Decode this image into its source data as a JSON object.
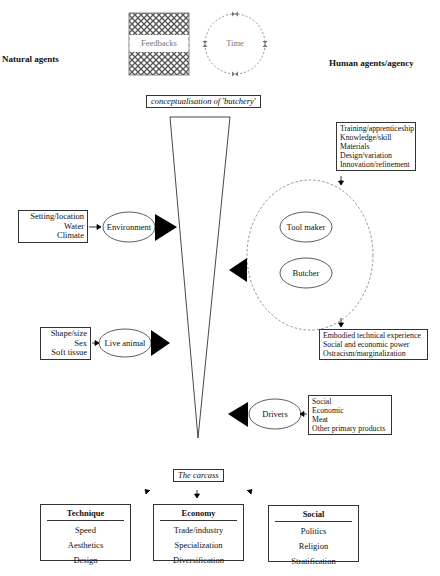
{
  "diagram": {
    "left_heading": "Natural agents",
    "right_heading": "Human agents/agency",
    "top_icons": {
      "feedbacks_label": "Feedbacks",
      "time_label": "Time"
    },
    "top_label": "conceptualisation of 'butchery'",
    "bottom_label": "The carcass",
    "natural": {
      "environment": {
        "label": "Environment",
        "factors": [
          "Setting/location",
          "Water",
          "Climate"
        ]
      },
      "live_animal": {
        "label": "Live animal",
        "factors": [
          "Shape/size",
          "Sex",
          "Soft tissue"
        ]
      }
    },
    "human": {
      "inputs": [
        "Training/apprenticeship",
        "Knowledge/skill",
        "Materials",
        "Design/variation",
        "Innovation/refinement"
      ],
      "agents": [
        "Tool maker",
        "Butcher"
      ],
      "outputs": [
        "Embodied technical experience",
        "Social and economic power",
        "Ostracism/marginalization"
      ],
      "drivers": {
        "label": "Drivers",
        "factors": [
          "Social",
          "Economic",
          "Meat",
          "Other primary products"
        ]
      }
    },
    "outcomes": [
      {
        "title": "Technique",
        "items": [
          "Speed",
          "Aesthetics",
          "Design"
        ]
      },
      {
        "title": "Economy",
        "items": [
          "Trade/industry",
          "Specialization",
          "Diversification"
        ]
      },
      {
        "title": "Social",
        "items": [
          "Politics",
          "Religion",
          "Stratification"
        ]
      }
    ],
    "colors": {
      "line": "#333333",
      "dashed": "#777777",
      "arrow_fill": "#000000",
      "hatch": "#555555",
      "muted_text": "#777777"
    }
  }
}
